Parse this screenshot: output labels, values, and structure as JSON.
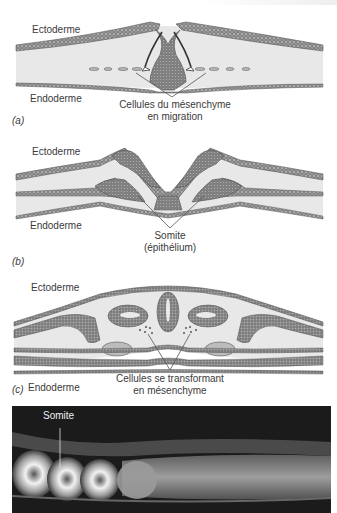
{
  "figure": {
    "panels": [
      {
        "id": "a",
        "tag": "(a)",
        "labels": {
          "ectoderm": "Ectoderme",
          "endoderm": "Endoderme",
          "caption_line1": "Cellules du mésenchyme",
          "caption_line2": "en migration"
        }
      },
      {
        "id": "b",
        "tag": "(b)",
        "labels": {
          "ectoderm": "Ectoderme",
          "endoderm": "Endoderme",
          "caption_line1": "Somite",
          "caption_line2": "(épithélium)"
        }
      },
      {
        "id": "c",
        "tag": "(c)",
        "labels": {
          "ectoderm": "Ectoderme",
          "endoderm": "Endoderme",
          "caption_line1": "Cellules se transformant",
          "caption_line2": "en mésenchyme"
        }
      }
    ],
    "micrograph": {
      "label": "Somite"
    },
    "colors": {
      "cell_fill": "#8c8c8c",
      "cell_stroke": "#555555",
      "background_band": "#e6e6e6",
      "leader_line": "#555555",
      "micrograph_bg": "#1b1b1b"
    }
  }
}
